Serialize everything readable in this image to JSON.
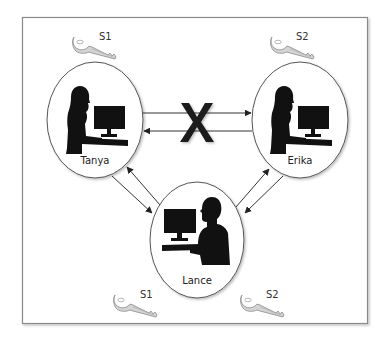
{
  "diagram": {
    "type": "key-distribution-network",
    "frame": {
      "border_color": "#8a8a8a"
    },
    "colors": {
      "silhouette": "#111111",
      "ellipse_stroke": "#555555",
      "arrow": "#333333",
      "key_fill": "#d4d4d4",
      "key_stroke": "#8a8a8a",
      "blocked_x": "#1a1a1a"
    },
    "nodes": [
      {
        "id": "tanya",
        "label": "Tanya",
        "silhouette": "female-at-computer",
        "key": {
          "label": "S1",
          "position": "top"
        }
      },
      {
        "id": "erika",
        "label": "Erika",
        "silhouette": "female-at-computer",
        "key": {
          "label": "S2",
          "position": "top"
        }
      },
      {
        "id": "lance",
        "label": "Lance",
        "silhouette": "male-at-computer",
        "keys": [
          {
            "label": "S1"
          },
          {
            "label": "S2"
          }
        ]
      }
    ],
    "edges": [
      {
        "from": "tanya",
        "to": "erika",
        "blocked": true
      },
      {
        "from": "erika",
        "to": "tanya",
        "blocked": true
      },
      {
        "from": "tanya",
        "to": "lance",
        "blocked": false
      },
      {
        "from": "lance",
        "to": "tanya",
        "blocked": false
      },
      {
        "from": "erika",
        "to": "lance",
        "blocked": false
      },
      {
        "from": "lance",
        "to": "erika",
        "blocked": false
      }
    ],
    "blocked_marker": "X"
  }
}
